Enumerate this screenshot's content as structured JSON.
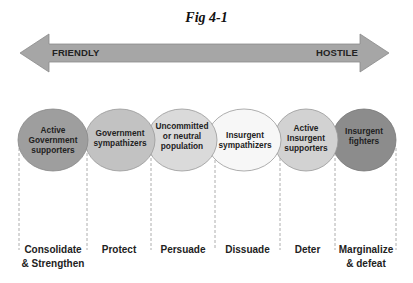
{
  "figure": {
    "title": "Fig 4-1"
  },
  "arrow": {
    "left_label": "FRIENDLY",
    "right_label": "HOSTILE",
    "color": "#a6a6a6"
  },
  "groups": [
    {
      "label": "Active Government supporters",
      "lines": [
        "Active",
        "Government",
        "supporters"
      ],
      "fill": "#9e9e9e"
    },
    {
      "label": "Government sympathizers",
      "lines": [
        "Government",
        "sympathizers"
      ],
      "fill": "#c2c2c2"
    },
    {
      "label": "Uncommitted or neutral population",
      "lines": [
        "Uncommitted",
        "or neutral",
        "population"
      ],
      "fill": "#dadada"
    },
    {
      "label": "Insurgent sympathizers",
      "lines": [
        "Insurgent",
        "sympathizers"
      ],
      "fill": "#f7f7f7"
    },
    {
      "label": "Active Insurgent supporters",
      "lines": [
        "Active",
        "Insurgent",
        "supporters"
      ],
      "fill": "#d2d2d2"
    },
    {
      "label": "Insurgent fighters",
      "lines": [
        "Insurgent",
        "fighters"
      ],
      "fill": "#8c8c8c"
    }
  ],
  "actions": [
    {
      "lines": [
        "Consolidate",
        "& Strengthen"
      ]
    },
    {
      "lines": [
        "Protect"
      ]
    },
    {
      "lines": [
        "Persuade"
      ]
    },
    {
      "lines": [
        "Dissuade"
      ]
    },
    {
      "lines": [
        "Deter"
      ]
    },
    {
      "lines": [
        "Marginalize",
        "& defeat"
      ]
    }
  ]
}
